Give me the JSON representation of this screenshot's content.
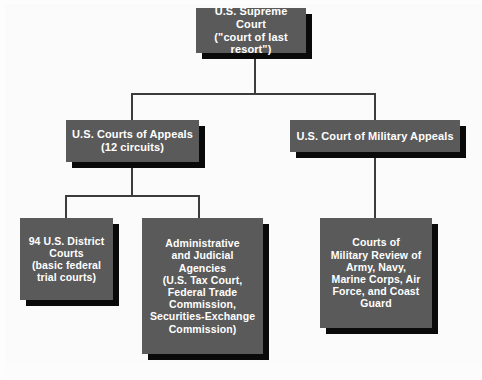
{
  "diagram": {
    "type": "organization-chart",
    "colors": {
      "box_fill": "#5a5a5a",
      "box_text": "#ffffff",
      "shadow": "#0a0a0a",
      "connector": "#3c3c3c",
      "background": "#fbfbfb"
    }
  },
  "nodes": {
    "supreme_court": {
      "id": "supreme-court",
      "level": 1,
      "label": "U.S. Supreme Court\n(\"court of last resort\")"
    },
    "courts_of_appeals": {
      "id": "courts-of-appeals",
      "level": 2,
      "label": "U.S. Courts of Appeals\n(12 circuits)"
    },
    "military_appeals": {
      "id": "military-appeals",
      "level": 2,
      "label": "U.S. Court of Military Appeals"
    },
    "district_courts": {
      "id": "district-courts",
      "level": 3,
      "label": "94 U.S. District\nCourts\n(basic federal\ntrial courts)"
    },
    "admin_agencies": {
      "id": "admin-agencies",
      "level": 3,
      "label": "Administrative\nand Judicial\nAgencies\n(U.S. Tax Court,\nFederal Trade\nCommission,\nSecurities-Exchange\nCommission)"
    },
    "military_review": {
      "id": "military-review",
      "level": 3,
      "label": "Courts of\nMilitary Review of\nArmy, Navy,\nMarine Corps, Air\nForce, and Coast\nGuard"
    }
  },
  "edges": [
    {
      "from": "supreme_court",
      "to": "courts_of_appeals"
    },
    {
      "from": "supreme_court",
      "to": "military_appeals"
    },
    {
      "from": "courts_of_appeals",
      "to": "district_courts"
    },
    {
      "from": "courts_of_appeals",
      "to": "admin_agencies"
    },
    {
      "from": "military_appeals",
      "to": "military_review"
    }
  ]
}
